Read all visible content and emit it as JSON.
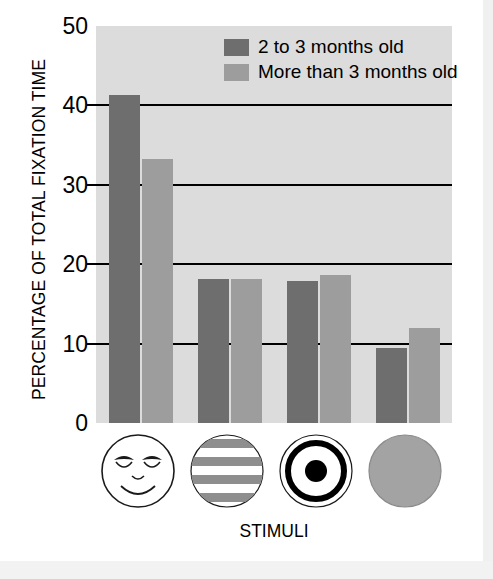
{
  "chart_data": {
    "type": "bar",
    "title": "",
    "xlabel": "STIMULI",
    "ylabel": "PERCENTAGE OF TOTAL FIXATION TIME",
    "ylim": [
      0,
      50
    ],
    "ytick_labels": [
      "50",
      "40",
      "30",
      "20",
      "10",
      "0"
    ],
    "ytick_values": [
      50,
      40,
      30,
      20,
      10,
      0
    ],
    "grid": "horizontal gridlines at 10, 20, 30, 40",
    "legend_position": "top-center-right inside plot",
    "categories": [
      "face",
      "stripes",
      "bullseye",
      "plain disk"
    ],
    "category_icons": [
      "smiling-face-icon",
      "horizontal-stripes-icon",
      "bullseye-icon",
      "plain-gray-disk-icon"
    ],
    "series": [
      {
        "name": "2 to 3 months old",
        "color": "#6e6e6e",
        "values": [
          41.3,
          18.2,
          17.9,
          9.5
        ]
      },
      {
        "name": "More than 3 months old",
        "color": "#9d9d9d",
        "values": [
          33.2,
          18.2,
          18.6,
          12.0
        ]
      }
    ]
  },
  "axes": {
    "y_title": "PERCENTAGE OF TOTAL FIXATION TIME",
    "x_title": "STIMULI"
  },
  "legend": {
    "items": [
      {
        "label": "2 to 3 months old",
        "swatch": "dark"
      },
      {
        "label": "More than 3 months old",
        "swatch": "light"
      }
    ]
  },
  "colors": {
    "plot_background": "#dcdcdc",
    "series_dark": "#6e6e6e",
    "series_light": "#9d9d9d",
    "axis": "#000000",
    "page_background": "#ffffff"
  }
}
